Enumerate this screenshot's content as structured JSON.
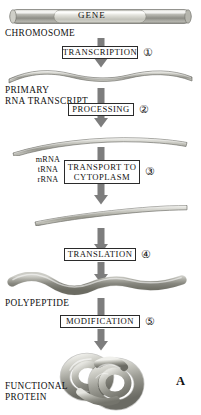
{
  "figure": {
    "panel_letter": "A",
    "background_color": "#ffffff",
    "arrow_color": "#7d7d7d",
    "ink_color": "#111111"
  },
  "chromosome": {
    "gene_label": "GENE",
    "structure_label": "CHROMOSOME",
    "icon": "chromosome-cylinder-icon"
  },
  "steps": [
    {
      "id": "transcription",
      "label": "TRANSCRIPTION",
      "number": "①"
    },
    {
      "id": "processing",
      "label": "PROCESSING",
      "number": "②"
    },
    {
      "id": "transport",
      "label": "TRANSPORT TO\nCYTOPLASM",
      "number": "③"
    },
    {
      "id": "translation",
      "label": "TRANSLATION",
      "number": "④"
    },
    {
      "id": "modification",
      "label": "MODIFICATION",
      "number": "⑤"
    }
  ],
  "products": {
    "primary_transcript": "PRIMARY\nRNA TRANSCRIPT",
    "rna_species": "mRNA\ntRNA\nrRNA",
    "polypeptide": "POLYPEPTIDE",
    "functional_protein": "FUNCTIONAL\nPROTEIN"
  },
  "icons": {
    "primary_transcript": "wavy-rna-strand-icon",
    "mature_rna": "curved-rna-strand-icon",
    "polypeptide": "wavy-polypeptide-chain-icon",
    "protein": "folded-protein-knot-icon",
    "arrow": "down-arrow-icon"
  }
}
